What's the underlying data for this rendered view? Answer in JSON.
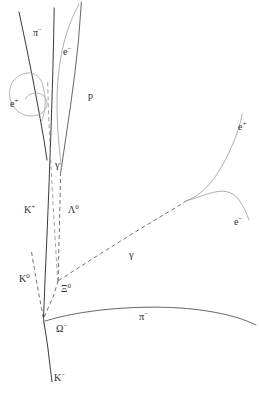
{
  "figure": {
    "type": "bubble-chamber-event-diagram",
    "background_color": "#ffffff",
    "width": 259,
    "height": 393,
    "ink_color": "#2b2b30",
    "faint_track_color": "#9a9aa2"
  },
  "labels": {
    "pi_minus_top": "π−",
    "e_minus_top": "e−",
    "proton": "p",
    "e_plus_spiral": "e+",
    "gamma_upper": "γ",
    "k_plus": "K+",
    "lambda_zero": "Λ0",
    "k_zero": "K0",
    "xi_zero": "Ξ0",
    "omega_minus": "Ω−",
    "k_minus": "K−",
    "gamma_lower": "γ",
    "e_plus_right": "e+",
    "e_minus_right": "e−",
    "pi_minus_lower": "π−"
  },
  "label_text": {
    "pi_minus_top": {
      "base": "π",
      "sup": "−"
    },
    "e_minus_top": {
      "base": "e",
      "sup": "−"
    },
    "proton": {
      "base": "p",
      "sup": ""
    },
    "e_plus_spiral": {
      "base": "e",
      "sup": "+"
    },
    "gamma_upper": {
      "base": "γ",
      "sup": ""
    },
    "k_plus": {
      "base": "K",
      "sup": "+"
    },
    "lambda_zero": {
      "base": "Λ",
      "sup": "0"
    },
    "k_zero": {
      "base": "K",
      "sup": "0"
    },
    "xi_zero": {
      "base": "Ξ",
      "sup": "0"
    },
    "omega_minus": {
      "base": "Ω",
      "sup": "−"
    },
    "k_minus": {
      "base": "K",
      "sup": "−"
    },
    "gamma_lower": {
      "base": "γ",
      "sup": ""
    },
    "e_plus_right": {
      "base": "e",
      "sup": "+"
    },
    "e_minus_right": {
      "base": "e",
      "sup": "−"
    },
    "pi_minus_lower": {
      "base": "π",
      "sup": "−"
    }
  },
  "tracks": [
    {
      "name": "k-minus-incoming",
      "particle": "K−",
      "style": "solid",
      "charged": true
    },
    {
      "name": "omega-minus",
      "particle": "Ω−",
      "style": "solid",
      "charged": true
    },
    {
      "name": "pi-minus-lower",
      "particle": "π−",
      "style": "solid",
      "charged": true
    },
    {
      "name": "xi-zero",
      "particle": "Ξ0",
      "style": "dashed",
      "charged": false
    },
    {
      "name": "k-zero",
      "particle": "K0",
      "style": "dashed",
      "charged": false
    },
    {
      "name": "k-plus",
      "particle": "K+",
      "style": "solid",
      "charged": true
    },
    {
      "name": "lambda-zero",
      "particle": "Λ0",
      "style": "dashed",
      "charged": false
    },
    {
      "name": "gamma-upper",
      "particle": "γ",
      "style": "dashed",
      "charged": false
    },
    {
      "name": "gamma-lower",
      "particle": "γ",
      "style": "dashed",
      "charged": false
    },
    {
      "name": "proton",
      "particle": "p",
      "style": "solid",
      "charged": true
    },
    {
      "name": "pi-minus-top",
      "particle": "π−",
      "style": "solid",
      "charged": true
    },
    {
      "name": "e-minus-top",
      "particle": "e−",
      "style": "faint",
      "charged": true
    },
    {
      "name": "e-plus-spiral",
      "particle": "e+",
      "style": "faint",
      "charged": true
    },
    {
      "name": "e-plus-right",
      "particle": "e+",
      "style": "faint",
      "charged": true
    },
    {
      "name": "e-minus-right",
      "particle": "e−",
      "style": "faint",
      "charged": true
    }
  ]
}
